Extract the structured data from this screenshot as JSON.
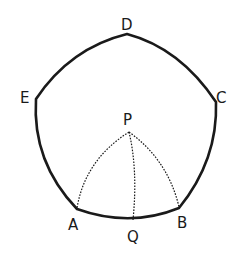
{
  "diagram": {
    "type": "spherical pentagon with interior point",
    "colors": {
      "stroke": "#1a1a1a",
      "background": "#ffffff"
    },
    "vertices": {
      "D": {
        "label": "D",
        "x": 127,
        "y": 34
      },
      "C": {
        "label": "C",
        "x": 216,
        "y": 102
      },
      "B": {
        "label": "B",
        "x": 179,
        "y": 208
      },
      "A": {
        "label": "A",
        "x": 77,
        "y": 209
      },
      "E": {
        "label": "E",
        "x": 36,
        "y": 99
      }
    },
    "interior_points": {
      "P": {
        "label": "P",
        "x": 129,
        "y": 132
      },
      "Q": {
        "label": "Q",
        "x": 133,
        "y": 220
      }
    },
    "dotted_arcs": [
      "P-A",
      "P-Q",
      "P-B"
    ],
    "labels": {
      "D": "D",
      "E": "E",
      "C": "C",
      "P": "P",
      "A": "A",
      "Q": "Q",
      "B": "B"
    }
  }
}
